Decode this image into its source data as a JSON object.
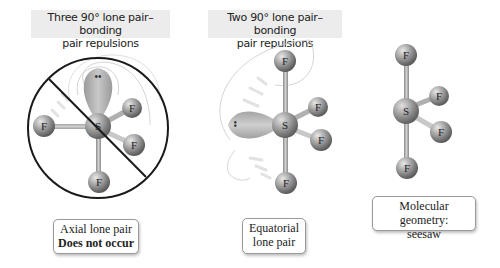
{
  "panels": [
    {
      "id": "axial",
      "header": [
        "Three 90° lone pair–bonding",
        "pair repulsions"
      ],
      "caption": [
        "Axial lone pair",
        "Does not occur"
      ],
      "central_atom": "S",
      "ligands": [
        "F",
        "F",
        "F",
        "F"
      ],
      "lone_pair_dots": "••",
      "crossed_out": true
    },
    {
      "id": "equatorial",
      "header": [
        "Two 90° lone pair–bonding",
        "pair repulsions"
      ],
      "caption": [
        "Equatorial",
        "lone pair"
      ],
      "central_atom": "S",
      "ligands": [
        "F",
        "F",
        "F",
        "F"
      ],
      "lone_pair_dots": "••",
      "crossed_out": false
    },
    {
      "id": "geometry",
      "caption": [
        "Molecular geometry:",
        "seesaw"
      ],
      "central_atom": "S",
      "ligands": [
        "F",
        "F",
        "F",
        "F"
      ]
    }
  ],
  "colors": {
    "atom": "#9a9a9a",
    "lone_pair": "#b5b5b5",
    "prohibition": "#1a1a1a",
    "header_bg": "#ececec"
  }
}
